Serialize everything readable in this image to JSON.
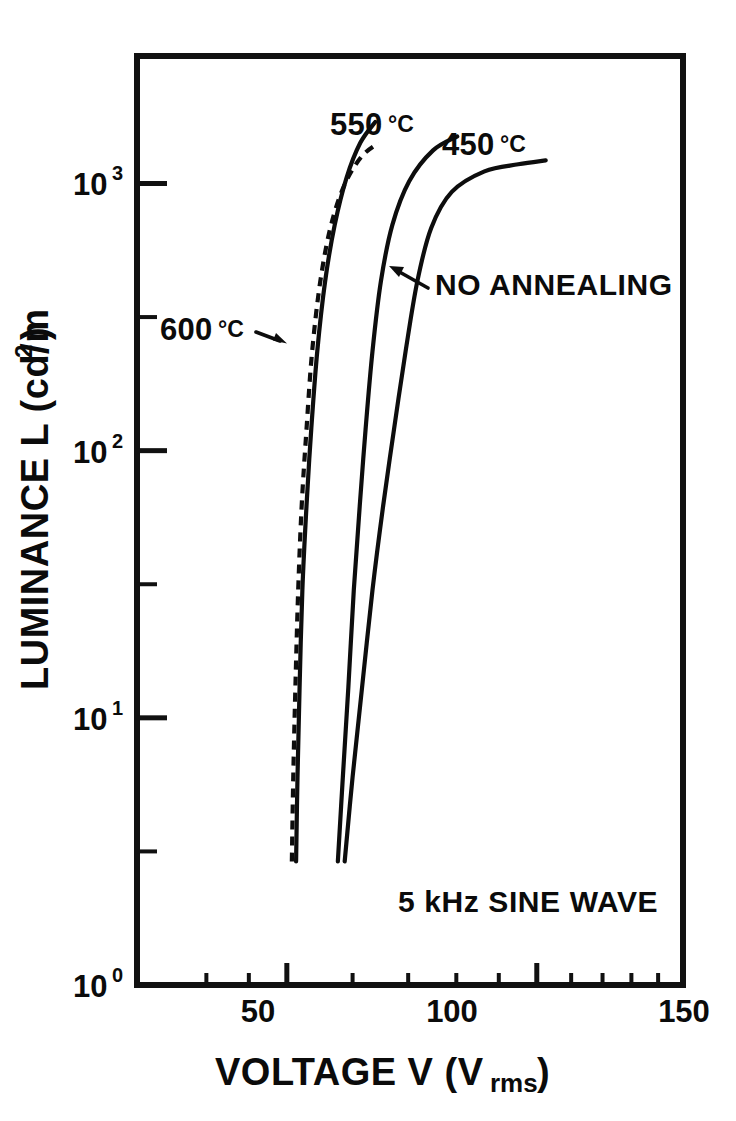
{
  "figure": {
    "background": "#ffffff",
    "ink_color": "#0d0d0d"
  },
  "axes": {
    "x_title_main": "VOLTAGE V (V",
    "x_title_sub": "rms",
    "x_title_tail": ")",
    "y_title_main": "LUMINANCE L (cd/m",
    "y_title_sup": "2",
    "y_title_tail": ")",
    "x_tick_labels": [
      "50",
      "100",
      "150"
    ],
    "y_tick_mantissa": "10",
    "y_tick_exponents": [
      "3",
      "2",
      "1",
      "0"
    ]
  },
  "annotations": {
    "note_drive": "5 kHz  SINE WAVE",
    "label_no_annealing": "NO ANNEALING",
    "label_550": "550",
    "label_550_unit": "°C",
    "label_450": "450",
    "label_450_unit": "°C",
    "label_600": "600",
    "label_600_unit": "°C"
  },
  "chart_data": {
    "type": "line",
    "title": "",
    "xlabel": "VOLTAGE V (Vrms)",
    "ylabel": "LUMINANCE L (cd/m2)",
    "xscale": "log",
    "yscale": "log",
    "xlim": [
      33,
      150
    ],
    "ylim": [
      1,
      3000
    ],
    "xticks_major": [
      50,
      100,
      150
    ],
    "xticks_minor": [
      40,
      45,
      60,
      70,
      80,
      90,
      110,
      120,
      130,
      140
    ],
    "yticks_major": [
      1,
      10,
      100,
      1000
    ],
    "yticks_minor": [
      3.162,
      31.62,
      316.2
    ],
    "grid": false,
    "legend": "inline-labels",
    "drive_condition": "5 kHz SINE WAVE",
    "series": [
      {
        "name": "600 °C",
        "style": "dashed",
        "label_text": "600 °C",
        "points": [
          [
            50.7,
            2.9
          ],
          [
            50.9,
            6.0
          ],
          [
            51.2,
            13.0
          ],
          [
            51.6,
            30.0
          ],
          [
            52.1,
            62.0
          ],
          [
            52.8,
            120.0
          ],
          [
            53.6,
            230.0
          ],
          [
            54.8,
            420.0
          ],
          [
            56.4,
            680.0
          ],
          [
            58.6,
            980.0
          ],
          [
            61.5,
            1260.0
          ],
          [
            64.5,
            1420.0
          ]
        ]
      },
      {
        "name": "550 °C",
        "style": "solid",
        "label_text": "550 °C",
        "points": [
          [
            51.3,
            2.9
          ],
          [
            51.5,
            6.0
          ],
          [
            51.8,
            13.0
          ],
          [
            52.2,
            30.0
          ],
          [
            52.8,
            62.0
          ],
          [
            53.5,
            120.0
          ],
          [
            54.4,
            235.0
          ],
          [
            55.6,
            430.0
          ],
          [
            57.1,
            700.0
          ],
          [
            59.0,
            1050.0
          ],
          [
            61.3,
            1420.0
          ],
          [
            63.9,
            1700.0
          ]
        ]
      },
      {
        "name": "450 °C",
        "style": "solid",
        "label_text": "450 °C",
        "points": [
          [
            57.6,
            2.9
          ],
          [
            58.4,
            6.0
          ],
          [
            59.3,
            13.0
          ],
          [
            60.2,
            30.0
          ],
          [
            61.2,
            62.0
          ],
          [
            62.2,
            120.0
          ],
          [
            63.4,
            235.0
          ],
          [
            64.9,
            430.0
          ],
          [
            67.0,
            700.0
          ],
          [
            70.2,
            1020.0
          ],
          [
            75.0,
            1330.0
          ],
          [
            80.2,
            1500.0
          ]
        ]
      },
      {
        "name": "NO ANNEALING",
        "style": "solid",
        "label_text": "NO ANNEALING",
        "points": [
          [
            58.7,
            2.9
          ],
          [
            60.0,
            6.0
          ],
          [
            61.6,
            13.0
          ],
          [
            63.4,
            30.0
          ],
          [
            65.3,
            62.0
          ],
          [
            67.3,
            120.0
          ],
          [
            69.5,
            235.0
          ],
          [
            71.8,
            430.0
          ],
          [
            74.6,
            680.0
          ],
          [
            79.0,
            930.0
          ],
          [
            86.5,
            1110.0
          ],
          [
            95.0,
            1180.0
          ],
          [
            102.5,
            1220.0
          ]
        ]
      }
    ]
  }
}
